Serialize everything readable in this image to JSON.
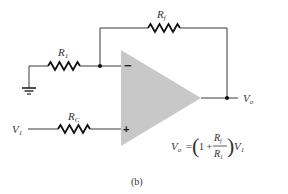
{
  "diagram": {
    "type": "non-inverting op-amp amplifier",
    "caption": "(b)",
    "colors": {
      "opamp_fill": "#c8c8c8",
      "wire": "#3a3a3a",
      "resistor": "#111111",
      "text": "#333333"
    },
    "components": {
      "rf": {
        "label": "R",
        "sub": "f"
      },
      "r1": {
        "label": "R",
        "sub": "1"
      },
      "rc": {
        "label": "R",
        "sub": "C"
      },
      "opamp": {
        "inverting_sign": "−",
        "noninverting_sign": "+"
      },
      "ground": {
        "label": "ground"
      }
    },
    "terminals": {
      "input": {
        "label": "V",
        "sub": "1"
      },
      "output": {
        "label": "V",
        "sub": "o"
      }
    },
    "formula": {
      "lhs": {
        "label": "V",
        "sub": "o"
      },
      "equals": "=",
      "one_plus": "1 +",
      "numerator": {
        "label": "R",
        "sub": "f"
      },
      "denominator": {
        "label": "R",
        "sub": "1"
      },
      "rhs": {
        "label": "V",
        "sub": "1"
      }
    }
  }
}
